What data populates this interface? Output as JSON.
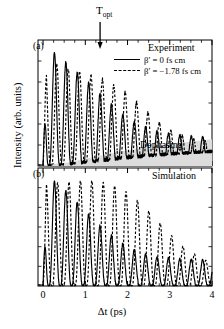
{
  "figure": {
    "topt_marker": "T",
    "topt_sub": "opt",
    "topt_x_ps": 1.35,
    "dephasing_label": "Dephasing",
    "xlabel": "Δt (ps)",
    "ylabel": "Intensity (arb. units)",
    "xticks": [
      "0",
      "1",
      "2",
      "3",
      "4"
    ],
    "xlim": [
      -0.12,
      4.0
    ],
    "panels": [
      {
        "id": "a",
        "tag": "(a)",
        "title": "Experiment"
      },
      {
        "id": "b",
        "tag": "(b)",
        "title": "Simulation"
      }
    ],
    "legend": [
      {
        "style": "solid",
        "label": "β′ = 0 fs cm"
      },
      {
        "style": "dash",
        "label": "β′ = −1.78 fs cm"
      }
    ],
    "colors": {
      "line": "#000000",
      "dephasing_fill": "#dcdcdc",
      "axis": "#000000",
      "background": "#ffffff"
    }
  },
  "chart_data": {
    "type": "line",
    "title": "",
    "xlabel": "Δt (ps)",
    "ylabel": "Intensity (arb. units)",
    "xlim": [
      -0.12,
      4.0
    ],
    "ylim": [
      0,
      1.05
    ],
    "grid": false,
    "legend_position": "top-right",
    "annotations": [
      {
        "text": "T_opt",
        "x": 1.35,
        "kind": "down-arrow"
      },
      {
        "text": "Dephasing",
        "x": 2.6,
        "y": 0.12,
        "kind": "region-label"
      },
      {
        "text": "Experiment",
        "panel": "a",
        "kind": "panel-title"
      },
      {
        "text": "Simulation",
        "panel": "b",
        "kind": "panel-title"
      }
    ],
    "oscillation_period_ps": 0.27,
    "panels": [
      {
        "id": "a",
        "tag": "(a)",
        "title": "Experiment",
        "noise_amplitude": 0.035,
        "dephasing_envelope": {
          "description": "shaded wedge rising from baseline",
          "x": [
            0.0,
            0.6,
            1.2,
            1.8,
            2.4,
            3.0,
            3.6,
            4.0
          ],
          "y": [
            0.005,
            0.03,
            0.075,
            0.12,
            0.155,
            0.185,
            0.21,
            0.225
          ]
        },
        "series": [
          {
            "name": "β′ = 0 fs cm",
            "style": "solid",
            "phase_ps": 0.0,
            "decay_tau_ps": 1.05,
            "envelope_x": [
              0.0,
              0.3,
              0.6,
              0.9,
              1.2,
              1.5,
              1.8,
              2.1,
              2.4,
              2.7,
              3.0,
              3.4,
              4.0
            ],
            "envelope_y": [
              1.0,
              0.95,
              0.86,
              0.76,
              0.66,
              0.55,
              0.46,
              0.38,
              0.33,
              0.29,
              0.27,
              0.25,
              0.24
            ]
          },
          {
            "name": "β′ = −1.78 fs cm",
            "style": "dash",
            "phase_ps": 0.055,
            "decay_tau_ps": 1.55,
            "envelope_x": [
              0.0,
              0.3,
              0.6,
              0.9,
              1.2,
              1.5,
              1.8,
              2.1,
              2.4,
              2.7,
              3.0,
              3.4,
              4.0
            ],
            "envelope_y": [
              0.88,
              0.86,
              0.82,
              0.79,
              0.76,
              0.72,
              0.66,
              0.58,
              0.48,
              0.38,
              0.3,
              0.24,
              0.2
            ]
          }
        ]
      },
      {
        "id": "b",
        "tag": "(b)",
        "title": "Simulation",
        "noise_amplitude": 0.03,
        "series": [
          {
            "name": "β′ = 0 fs cm",
            "style": "solid",
            "phase_ps": 0.0,
            "decay_tau_ps": 0.95,
            "envelope_x": [
              0.0,
              0.3,
              0.6,
              0.9,
              1.2,
              1.5,
              1.8,
              2.1,
              2.4,
              2.7,
              3.0,
              3.4,
              4.0
            ],
            "envelope_y": [
              1.0,
              0.94,
              0.84,
              0.72,
              0.6,
              0.49,
              0.4,
              0.33,
              0.29,
              0.26,
              0.25,
              0.24,
              0.23
            ]
          },
          {
            "name": "β′ = −1.78 fs cm",
            "style": "dash",
            "phase_ps": 0.075,
            "decay_tau_ps": 1.9,
            "envelope_x": [
              0.0,
              0.3,
              0.6,
              0.9,
              1.2,
              1.5,
              1.8,
              2.1,
              2.4,
              2.7,
              3.0,
              3.4,
              4.0
            ],
            "envelope_y": [
              0.92,
              0.93,
              0.94,
              0.95,
              0.95,
              0.93,
              0.89,
              0.82,
              0.72,
              0.6,
              0.47,
              0.33,
              0.2
            ]
          }
        ]
      }
    ]
  }
}
